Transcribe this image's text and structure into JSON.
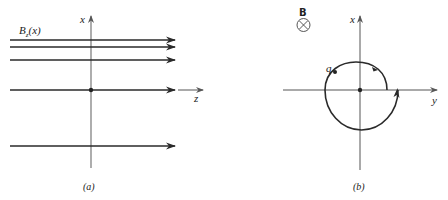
{
  "panel_a": {
    "caption": "(a)",
    "field_label_main": "B",
    "field_label_sub": "z",
    "field_label_arg": "(x)",
    "vertical_axis_label": "x",
    "horizontal_axis_label": "z",
    "field_lines_y": [
      40,
      47,
      60,
      90,
      146
    ]
  },
  "panel_b": {
    "caption": "(b)",
    "field_symbol_label": "B",
    "field_direction": "into-page",
    "vertical_axis_label": "x",
    "horizontal_axis_label": "y",
    "charge_label": "q"
  },
  "colors": {
    "line": "#2a2a2a",
    "axis": "#555555",
    "text": "#222222"
  }
}
